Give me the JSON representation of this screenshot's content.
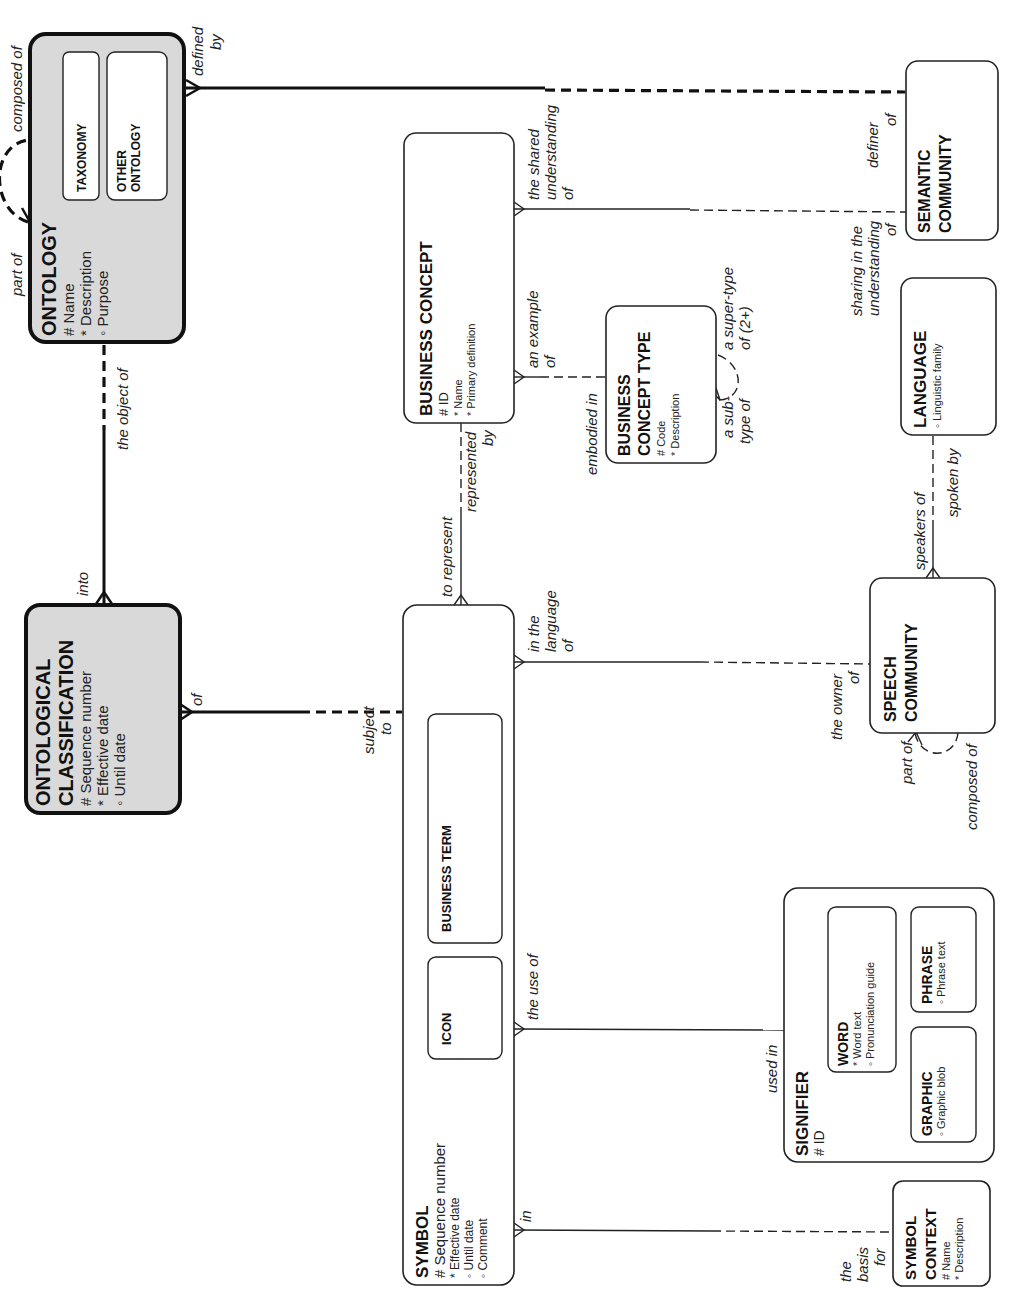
{
  "diagram": {
    "type": "entity-relationship",
    "orientation": "rotated -90deg",
    "entities": {
      "ontology": {
        "title": "ONTOLOGY",
        "attributes": [
          "# Name",
          "* Description",
          "◦ Purpose"
        ],
        "subtypes": [
          "TAXONOMY",
          "OTHER",
          "ONTOLOGY"
        ],
        "fill": "#d9d9d9"
      },
      "ontological_classification": {
        "title_line1": "ONTOLOGICAL",
        "title_line2": "CLASSIFICATION",
        "attributes": [
          "# Sequence number",
          "* Effective date",
          "◦ Until date"
        ],
        "fill": "#d9d9d9"
      },
      "business_concept": {
        "title": "BUSINESS CONCEPT",
        "attributes": [
          "# ID",
          "* Name",
          "* Primary definition"
        ]
      },
      "business_concept_type": {
        "title_line1": "BUSINESS",
        "title_line2": "CONCEPT TYPE",
        "attributes": [
          "# Code",
          "* Description"
        ]
      },
      "semantic_community": {
        "title_line1": "SEMANTIC",
        "title_line2": "COMMUNITY"
      },
      "language": {
        "title": "LANGUAGE",
        "attributes": [
          "◦ Linguistic family"
        ]
      },
      "speech_community": {
        "title_line1": "SPEECH",
        "title_line2": "COMMUNITY"
      },
      "symbol": {
        "title": "SYMBOL",
        "attributes": [
          "# Sequence number",
          "* Effective date",
          "◦ Until date",
          "◦ Comment"
        ],
        "subtypes": [
          "ICON",
          "BUSINESS TERM"
        ]
      },
      "signifier": {
        "title": "SIGNIFIER",
        "attributes": [
          "# ID"
        ],
        "subtypes": {
          "word": {
            "title": "WORD",
            "attributes": [
              "* Word text",
              "◦ Pronunciation guide"
            ]
          },
          "phrase": {
            "title": "PHRASE",
            "attributes": [
              "◦ Phrase text"
            ]
          },
          "graphic": {
            "title": "GRAPHIC",
            "attributes": [
              "◦ Graphic blob"
            ]
          }
        }
      },
      "symbol_context": {
        "title_line1": "SYMBOL",
        "title_line2": "CONTEXT",
        "attributes": [
          "# Name",
          "* Description"
        ]
      }
    },
    "relationships": {
      "ontology_self": {
        "a": "part of",
        "b": "composed of"
      },
      "ontology_semantic": {
        "a1": "defined",
        "a2": "by",
        "b1": "definer",
        "b2": "of"
      },
      "ontology_classification": {
        "a": "the object of",
        "b": "into"
      },
      "classification_symbol": {
        "a": "of",
        "b1": "subject",
        "b2": "to"
      },
      "concept_semantic": {
        "a1": "the shared",
        "a2": "understanding",
        "a3": "of",
        "b1": "sharing in the",
        "b2": "understanding",
        "b3": "of"
      },
      "concept_type": {
        "a1": "an example",
        "a2": "of",
        "b": "embodied in"
      },
      "type_self": {
        "a1": "a sub-",
        "a2": "type of",
        "b1": "a super-type",
        "b2": "of (2+)"
      },
      "concept_symbol": {
        "a1": "represented",
        "a2": "by",
        "b": "to represent"
      },
      "language_speech": {
        "a": "speakers of",
        "b": "spoken by"
      },
      "symbol_speech": {
        "a1": "in the",
        "a2": "language",
        "a3": "of",
        "b1": "the owner",
        "b2": "of"
      },
      "speech_self": {
        "a": "part of",
        "b": "composed of"
      },
      "symbol_signifier": {
        "a": "the use of",
        "b": "used in"
      },
      "symbol_context": {
        "a": "in",
        "b1": "the",
        "b2": "basis",
        "b3": "for"
      }
    }
  }
}
